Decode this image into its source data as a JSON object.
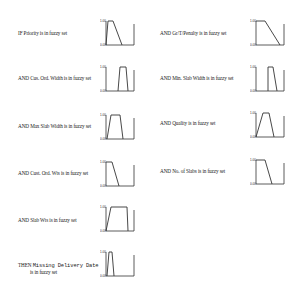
{
  "rules": [
    {
      "id": "priority",
      "text": "IF Priority is in fuzzy set",
      "x": 18,
      "y": 30,
      "chart": {
        "x": 100,
        "y": 17,
        "shape": [
          [
            0,
            0
          ],
          [
            2,
            1
          ],
          [
            7,
            1
          ],
          [
            16,
            0
          ]
        ]
      }
    },
    {
      "id": "gr-t-penalty",
      "text": "AND Gr/T/Penalty is in fuzzy set",
      "x": 160,
      "y": 30,
      "chart": {
        "x": 250,
        "y": 17,
        "shape": [
          [
            0,
            1
          ],
          [
            9,
            1
          ],
          [
            24,
            0
          ]
        ]
      }
    },
    {
      "id": "cus-ord-width",
      "text": "AND Cus. Ord. Width is in fuzzy set",
      "x": 18,
      "y": 75,
      "chart": {
        "x": 100,
        "y": 63,
        "shape": [
          [
            12,
            0
          ],
          [
            14,
            1
          ],
          [
            20,
            1
          ],
          [
            22,
            0
          ]
        ]
      }
    },
    {
      "id": "min-slab-width",
      "text": "AND Min. Slab Width is in fuzzy set",
      "x": 160,
      "y": 75,
      "chart": {
        "x": 250,
        "y": 63,
        "shape": [
          [
            12,
            0
          ],
          [
            12,
            1
          ],
          [
            17,
            1
          ],
          [
            21,
            0
          ]
        ]
      }
    },
    {
      "id": "max-slab-width",
      "text": "AND Max Slab Width is in fuzzy set",
      "x": 18,
      "y": 123,
      "chart": {
        "x": 100,
        "y": 111,
        "shape": [
          [
            1,
            0
          ],
          [
            5,
            1
          ],
          [
            14,
            1
          ],
          [
            17,
            0
          ]
        ]
      }
    },
    {
      "id": "quality",
      "text": "AND Quality is in fuzzy set",
      "x": 160,
      "y": 120,
      "chart": {
        "x": 250,
        "y": 109,
        "shape": [
          [
            0,
            0
          ],
          [
            7,
            1
          ],
          [
            13,
            1
          ],
          [
            18,
            0
          ]
        ]
      }
    },
    {
      "id": "cust-ord-wts",
      "text": "AND Cust. Ord. Wts is in fuzzy set",
      "x": 18,
      "y": 170,
      "chart": {
        "x": 100,
        "y": 158,
        "shape": [
          [
            0,
            1
          ],
          [
            6,
            1
          ],
          [
            13,
            0
          ]
        ]
      }
    },
    {
      "id": "no-of-slabs",
      "text": "AND No. of Slabs is in fuzzy set",
      "x": 160,
      "y": 168,
      "chart": {
        "x": 250,
        "y": 156,
        "shape": [
          [
            0,
            1
          ],
          [
            9,
            1
          ],
          [
            16,
            0
          ]
        ]
      }
    },
    {
      "id": "slab-wts",
      "text": "AND Slab Wts is in fuzzy set",
      "x": 18,
      "y": 217,
      "chart": {
        "x": 100,
        "y": 203,
        "shape": [
          [
            0,
            0
          ],
          [
            5,
            1
          ],
          [
            21,
            1
          ],
          [
            22,
            0
          ]
        ]
      }
    },
    {
      "id": "missing-delivery-date",
      "text_prefix": "THEN",
      "text_mono": "Missing Delivery Date",
      "text_line2": "is in fuzzy set",
      "x": 18,
      "y": 262,
      "chart": {
        "x": 100,
        "y": 248,
        "shape": [
          [
            1,
            0
          ],
          [
            3,
            1
          ],
          [
            6,
            1
          ],
          [
            8,
            0
          ]
        ]
      }
    }
  ],
  "axis_labels": {
    "top": "1.00",
    "bottom": "0.00"
  },
  "colors": {
    "line": "#333333",
    "text": "#1a1a1a",
    "background": "#ffffff"
  }
}
